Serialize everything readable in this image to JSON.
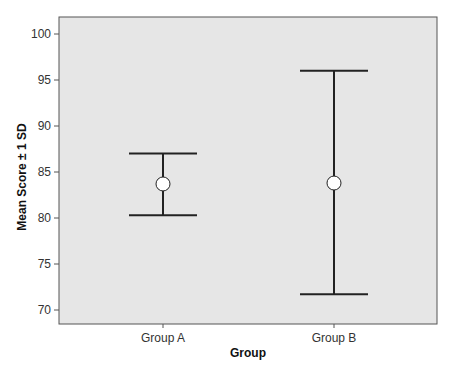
{
  "chart_data": {
    "type": "errorbar",
    "title": "",
    "xlabel": "Group",
    "ylabel": "Mean Score ± 1 SD",
    "categories": [
      "Group A",
      "Group B"
    ],
    "series": [
      {
        "name": "Mean Score",
        "values": [
          83.7,
          83.8
        ],
        "error_lower": [
          80.3,
          71.7
        ],
        "error_upper": [
          87.0,
          96.0
        ]
      }
    ],
    "ylim": [
      68.5,
      101.8
    ],
    "yticks": [
      70,
      75,
      80,
      85,
      90,
      95,
      100
    ],
    "grid": false,
    "legend": null,
    "colors": {
      "plot_background": "#e6e6e6",
      "line": "#222222",
      "marker_fill": "#ffffff",
      "axis": "#555555"
    }
  }
}
